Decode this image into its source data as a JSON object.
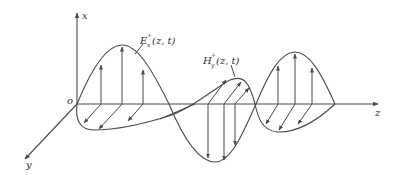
{
  "diagram": {
    "title": "",
    "axes": {
      "x_label": "x",
      "y_label": "y",
      "z_label": "z",
      "origin_label": "o"
    },
    "labels": {
      "e_field": "E",
      "e_sup": "+",
      "e_sub": "x",
      "e_args": "(z, t)",
      "h_field": "H",
      "h_sup": "+",
      "h_sub": "y",
      "h_args": "(z, t)"
    },
    "colors": {
      "line": "#4a4a4a",
      "text": "#333333",
      "background": "#ffffff"
    }
  }
}
